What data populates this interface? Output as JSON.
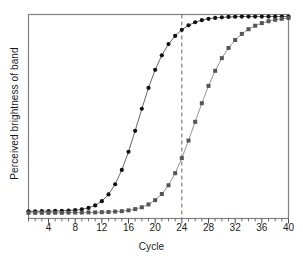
{
  "chart_data": {
    "type": "line",
    "title": "",
    "subtitle": "",
    "xlabel": "Cycle",
    "ylabel": "Perceived brightness of band",
    "xlim": [
      1,
      40
    ],
    "ylim": [
      0,
      1
    ],
    "xticks_major": [
      4,
      8,
      12,
      16,
      20,
      24,
      28,
      32,
      36,
      40
    ],
    "xtick_labels": [
      "4",
      "8",
      "12",
      "16",
      "20",
      "24",
      "28",
      "32",
      "36",
      "40"
    ],
    "xticks_minor_interval": 1,
    "yticks": [],
    "ytick_labels": [],
    "grid": false,
    "legend": false,
    "legend_position": "none",
    "frame": true,
    "annotations": [
      {
        "name": "reference-line",
        "type": "vline",
        "x": 24,
        "style": "dashed",
        "color": "#666666",
        "label": ""
      }
    ],
    "series": [
      {
        "name": "Early-onset band",
        "marker": "circle",
        "marker_color": "#111111",
        "line_color": "#555555",
        "x": [
          1,
          2,
          3,
          4,
          5,
          6,
          7,
          8,
          9,
          10,
          11,
          12,
          13,
          14,
          15,
          16,
          17,
          18,
          19,
          20,
          21,
          22,
          23,
          24,
          25,
          26,
          27,
          28,
          29,
          30,
          31,
          32,
          33,
          34,
          35,
          36,
          37,
          38,
          39,
          40
        ],
        "values": [
          0.035,
          0.035,
          0.036,
          0.036,
          0.037,
          0.038,
          0.039,
          0.041,
          0.045,
          0.052,
          0.064,
          0.085,
          0.118,
          0.168,
          0.238,
          0.327,
          0.43,
          0.538,
          0.64,
          0.729,
          0.8,
          0.855,
          0.895,
          0.925,
          0.947,
          0.962,
          0.972,
          0.979,
          0.983,
          0.986,
          0.988,
          0.989,
          0.99,
          0.99,
          0.99,
          0.99,
          0.99,
          0.99,
          0.99,
          0.99
        ]
      },
      {
        "name": "Late-onset band",
        "marker": "square",
        "marker_color": "#555555",
        "line_color": "#888888",
        "x": [
          1,
          2,
          3,
          4,
          5,
          6,
          7,
          8,
          9,
          10,
          11,
          12,
          13,
          14,
          15,
          16,
          17,
          18,
          19,
          20,
          21,
          22,
          23,
          24,
          25,
          26,
          27,
          28,
          29,
          30,
          31,
          32,
          33,
          34,
          35,
          36,
          37,
          38,
          39,
          40
        ],
        "values": [
          0.028,
          0.028,
          0.028,
          0.028,
          0.028,
          0.028,
          0.029,
          0.029,
          0.029,
          0.03,
          0.03,
          0.031,
          0.032,
          0.034,
          0.036,
          0.04,
          0.046,
          0.055,
          0.069,
          0.09,
          0.12,
          0.163,
          0.222,
          0.296,
          0.382,
          0.474,
          0.565,
          0.65,
          0.724,
          0.786,
          0.836,
          0.875,
          0.905,
          0.928,
          0.945,
          0.958,
          0.967,
          0.974,
          0.979,
          0.983
        ]
      }
    ]
  },
  "axes": {
    "frame_color": "#808080",
    "tick_color": "#4d4d4d",
    "text_color": "#1a1a1a"
  }
}
